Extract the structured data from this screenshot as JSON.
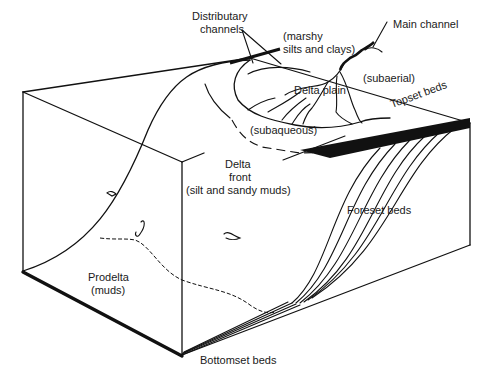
{
  "diagram": {
    "labels": {
      "distributary_channels_line1": "Distributary",
      "distributary_channels_line2": "channels",
      "marshy_line1": "(marshy",
      "marshy_line2": "silts and clays)",
      "main_channel": "Main channel",
      "subaerial": "(subaerial)",
      "delta_plain": "Delta plain",
      "topset_beds": "Topset beds",
      "subaqueous": "(subaqueous)",
      "delta_front_line1": "Delta",
      "delta_front_line2": "front",
      "delta_front_line3": "(silt and sandy muds)",
      "foreset_beds": "Foreset beds",
      "prodelta_line1": "Prodelta",
      "prodelta_line2": "(muds)",
      "bottomset_beds": "Bottomset beds"
    },
    "colors": {
      "line": "#111111",
      "background": "#ffffff",
      "text": "#1a1a1a"
    }
  }
}
